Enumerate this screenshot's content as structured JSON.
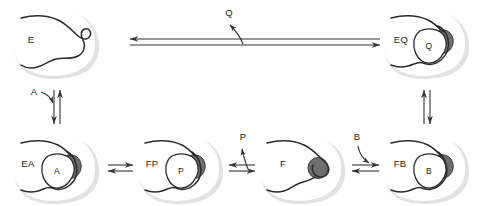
{
  "figure": {
    "type": "enzyme-kinetics-mechanism"
  },
  "colors": {
    "background": "#ffffff",
    "enzyme_shadow": "#e2e2e0",
    "enzyme_body": "#ffffff",
    "enzyme_outline": "#2b2b2b",
    "ligand_fill": "#ffffff",
    "catalytic_group": "#6e6e6e",
    "catalytic_group_outline": "#3a3a3a",
    "arrow": "#333333",
    "text": "#1a1a1a"
  },
  "states": [
    {
      "id": "E",
      "label": "E",
      "description": "free enzyme, open cleft",
      "ligand": null,
      "has_catalytic_group": false,
      "position": "top-left"
    },
    {
      "id": "EQ",
      "label": "EQ",
      "description": "enzyme with product Q bound",
      "ligand": "Q",
      "has_catalytic_group": true,
      "position": "top-right"
    },
    {
      "id": "EA",
      "label": "EA",
      "description": "enzyme with substrate A bound",
      "ligand": "A",
      "has_catalytic_group": true,
      "position": "bottom-1"
    },
    {
      "id": "FP",
      "label": "FP",
      "description": "modified enzyme with product P bound",
      "ligand": "P",
      "has_catalytic_group": true,
      "position": "bottom-2"
    },
    {
      "id": "F",
      "label": "F",
      "description": "modified (substituted) enzyme, closed cleft",
      "ligand": null,
      "has_catalytic_group": true,
      "position": "bottom-3"
    },
    {
      "id": "FB",
      "label": "FB",
      "description": "modified enzyme with substrate B bound",
      "ligand": "B",
      "has_catalytic_group": true,
      "position": "bottom-4"
    }
  ],
  "ligand_labels": {
    "Q_in_EQ": "Q",
    "A_in_EA": "A",
    "P_in_FP": "P",
    "B_in_FB": "B"
  },
  "reaction_steps": [
    {
      "id": "eq-to-e",
      "from": "EQ",
      "to": "E",
      "orientation": "horizontal",
      "reversible": true,
      "species_label": "Q",
      "species_action": "released"
    },
    {
      "id": "e-to-ea",
      "from": "E",
      "to": "EA",
      "orientation": "vertical",
      "reversible": true,
      "species_label": "A",
      "species_action": "binds"
    },
    {
      "id": "ea-to-fp",
      "from": "EA",
      "to": "FP",
      "orientation": "horizontal",
      "reversible": true,
      "species_label": null,
      "species_action": "catalysis"
    },
    {
      "id": "fp-to-f",
      "from": "FP",
      "to": "F",
      "orientation": "horizontal",
      "reversible": true,
      "species_label": "P",
      "species_action": "released"
    },
    {
      "id": "f-to-fb",
      "from": "F",
      "to": "FB",
      "orientation": "horizontal",
      "reversible": true,
      "species_label": "B",
      "species_action": "binds"
    },
    {
      "id": "fb-to-eq",
      "from": "FB",
      "to": "EQ",
      "orientation": "vertical",
      "reversible": true,
      "species_label": null,
      "species_action": "catalysis"
    }
  ],
  "free_species": {
    "Q": "Q",
    "A": "A",
    "P": "P",
    "B": "B"
  }
}
